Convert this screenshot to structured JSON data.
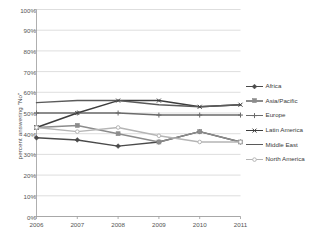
{
  "chart_data": {
    "type": "line",
    "title": "",
    "xlabel": "",
    "ylabel": "percent answering \"No\"",
    "categories": [
      "2006",
      "2007",
      "2008",
      "2009",
      "2010",
      "2011"
    ],
    "x": [
      2006,
      2007,
      2008,
      2009,
      2010,
      2011
    ],
    "ylim": [
      0,
      100
    ],
    "ytick_labels": [
      "0%",
      "10%",
      "20%",
      "30%",
      "40%",
      "50%",
      "60%",
      "70%",
      "80%",
      "90%",
      "100%"
    ],
    "ytick_values": [
      0,
      10,
      20,
      30,
      40,
      50,
      60,
      70,
      80,
      90,
      100
    ],
    "grid": "horizontal",
    "legend_position": "right",
    "series": [
      {
        "name": "Africa",
        "color": "#4a4a4a",
        "marker": "diamond",
        "values": [
          38,
          37,
          34,
          36,
          41,
          36
        ]
      },
      {
        "name": "Asia/Pacific",
        "color": "#8c8c8c",
        "marker": "square",
        "values": [
          43,
          44,
          40,
          36,
          41,
          36
        ]
      },
      {
        "name": "Europe",
        "color": "#6b6b6b",
        "marker": "cross",
        "values": [
          50,
          50,
          50,
          49,
          49,
          49
        ]
      },
      {
        "name": "Latin America",
        "color": "#3d3d3d",
        "marker": "x",
        "values": [
          43,
          50,
          56,
          56,
          53,
          54
        ]
      },
      {
        "name": "Middle East",
        "color": "#5a5a5a",
        "marker": "none",
        "values": [
          55,
          56,
          56,
          54,
          53,
          54
        ]
      },
      {
        "name": "North America",
        "color": "#b5b5b5",
        "marker": "circle",
        "values": [
          43,
          41,
          43,
          39,
          36,
          36
        ]
      }
    ]
  },
  "legend": {
    "entries": [
      {
        "label": "Africa"
      },
      {
        "label": "Asia/Pacific"
      },
      {
        "label": "Europe"
      },
      {
        "label": "Latin America"
      },
      {
        "label": "Middle East"
      },
      {
        "label": "North America"
      }
    ]
  },
  "colors": {
    "gridline": "#d0d0d0",
    "axis": "#9a9a9a",
    "plot_background": "#ffffff",
    "text": "#555555"
  }
}
